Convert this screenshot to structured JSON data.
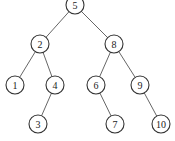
{
  "diagram": {
    "type": "binary-search-tree",
    "node_radius": 9,
    "nodes": [
      {
        "id": "n5",
        "label": "5",
        "x": 75,
        "y": 5
      },
      {
        "id": "n2",
        "label": "2",
        "x": 40,
        "y": 44
      },
      {
        "id": "n8",
        "label": "8",
        "x": 114,
        "y": 44
      },
      {
        "id": "n1",
        "label": "1",
        "x": 15,
        "y": 85
      },
      {
        "id": "n4",
        "label": "4",
        "x": 55,
        "y": 85
      },
      {
        "id": "n6",
        "label": "6",
        "x": 96,
        "y": 85
      },
      {
        "id": "n9",
        "label": "9",
        "x": 140,
        "y": 85
      },
      {
        "id": "n3",
        "label": "3",
        "x": 38,
        "y": 124
      },
      {
        "id": "n7",
        "label": "7",
        "x": 115,
        "y": 124
      },
      {
        "id": "n10",
        "label": "10",
        "x": 161,
        "y": 124
      }
    ],
    "edges": [
      {
        "from": "n5",
        "to": "n2"
      },
      {
        "from": "n5",
        "to": "n8"
      },
      {
        "from": "n2",
        "to": "n1"
      },
      {
        "from": "n2",
        "to": "n4"
      },
      {
        "from": "n8",
        "to": "n6"
      },
      {
        "from": "n8",
        "to": "n9"
      },
      {
        "from": "n4",
        "to": "n3"
      },
      {
        "from": "n6",
        "to": "n7"
      },
      {
        "from": "n9",
        "to": "n10"
      }
    ]
  }
}
